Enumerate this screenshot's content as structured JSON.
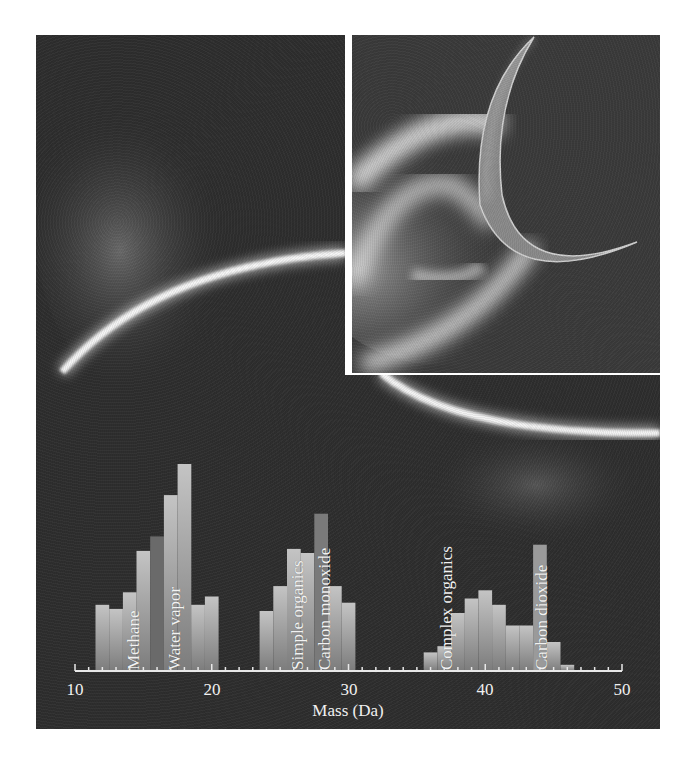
{
  "figure": {
    "panels": [
      {
        "name": "plume-limb-view",
        "description": "Grayscale image of moon limb with diffuse plume"
      },
      {
        "name": "crescent-plume-view",
        "description": "Grayscale image of crescent moon with bright backlit plume"
      }
    ]
  },
  "chart_data": {
    "type": "bar",
    "title": "",
    "xlabel": "Mass (Da)",
    "ylabel": "",
    "xlim": [
      10,
      50
    ],
    "x_ticks": [
      10,
      20,
      30,
      40,
      50
    ],
    "x_tick_labels": [
      "10",
      "20",
      "30",
      "40",
      "50"
    ],
    "grid": false,
    "legend": null,
    "y_units": "relative intensity (% of max, estimated)",
    "x": [
      12,
      13,
      14,
      15,
      16,
      17,
      18,
      19,
      20,
      24,
      25,
      26,
      27,
      28,
      29,
      30,
      36,
      37,
      38,
      39,
      40,
      41,
      42,
      43,
      44,
      45,
      46
    ],
    "values": [
      32,
      30,
      38,
      58,
      65,
      85,
      100,
      32,
      36,
      29,
      41,
      59,
      57,
      76,
      41,
      33,
      9,
      12,
      28,
      35,
      39,
      32,
      22,
      22,
      61,
      14,
      3
    ],
    "annotations": [
      {
        "text": "Methane",
        "x": 16
      },
      {
        "text": "Water vapor",
        "x": 18
      },
      {
        "text": "Simple organics",
        "x": 26
      },
      {
        "text": "Carbon monoxide",
        "x": 28
      },
      {
        "text": "Complex organics",
        "x": 39
      },
      {
        "text": "Carbon dioxide",
        "x": 44
      }
    ],
    "highlighted_bars": [
      {
        "name": "Methane",
        "x": 16,
        "color": "#6a6a6a"
      },
      {
        "name": "Carbon monoxide",
        "x": 28,
        "color": "#7a7a7a"
      },
      {
        "name": "Carbon dioxide",
        "x": 44,
        "color": "#9a9a9a"
      }
    ]
  },
  "labels": {
    "methane": "Methane",
    "water_vapor": "Water vapor",
    "simple_organics": "Simple organics",
    "carbon_monoxide": "Carbon monoxide",
    "complex_organics": "Complex organics",
    "carbon_dioxide": "Carbon dioxide",
    "xlabel": "Mass (Da)",
    "ticks": [
      "10",
      "20",
      "30",
      "40",
      "50"
    ]
  },
  "colors": {
    "background": "#2e2e2e",
    "bar_light": "#b8b8b8",
    "bar_mid": "#8c8c8c",
    "axis": "#e8e8e8",
    "text": "#f0f0f0"
  }
}
